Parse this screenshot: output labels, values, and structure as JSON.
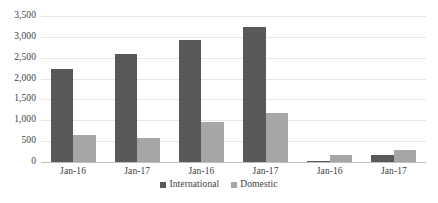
{
  "chart_data": {
    "type": "bar",
    "title": "",
    "subtitle": "",
    "xlabel": "",
    "ylabel": "",
    "categories": [
      "Jan-16",
      "Jan-17",
      "Jan-16",
      "Jan-17",
      "Jan-16",
      "Jan-17"
    ],
    "series": [
      {
        "name": "International",
        "color": "#595959",
        "values": [
          2230,
          2600,
          2930,
          3230,
          30,
          160
        ]
      },
      {
        "name": "Domestic",
        "color": "#a6a6a6",
        "values": [
          650,
          580,
          960,
          1180,
          170,
          280
        ]
      }
    ],
    "ylim": [
      0,
      3500
    ],
    "ytick_values": [
      0,
      500,
      1000,
      1500,
      2000,
      2500,
      3000,
      3500
    ],
    "ytick_labels": [
      "0",
      "500",
      "1,000",
      "1,500",
      "2,000",
      "2,500",
      "3,000",
      "3,500"
    ],
    "grid": true,
    "grid_color": "#e6e6e6",
    "axis_color": "#bfbfbf",
    "legend_position": "bottom",
    "legend_entries": [
      "International",
      "Domestic"
    ],
    "background_color": "#ffffff",
    "text_color": "#3d3d3d"
  }
}
